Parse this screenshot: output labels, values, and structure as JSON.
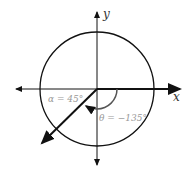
{
  "diagram": {
    "axes": {
      "x_label": "x",
      "y_label": "y"
    },
    "angles": [
      {
        "name": "alpha",
        "label": "α = 45°",
        "value_deg": 45
      },
      {
        "name": "theta",
        "label": "θ = −135°",
        "value_deg": -135
      }
    ],
    "colors": {
      "stroke": "#111111",
      "label": "#888888"
    }
  }
}
